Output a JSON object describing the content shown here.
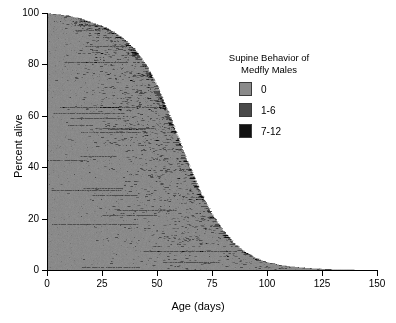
{
  "chart_data": {
    "type": "area",
    "title": "",
    "xlabel": "Age (days)",
    "ylabel": "Percent alive",
    "xlim": [
      0,
      150
    ],
    "ylim": [
      0,
      100
    ],
    "xticks": [
      0,
      25,
      50,
      75,
      100,
      125,
      150
    ],
    "yticks": [
      0,
      20,
      40,
      60,
      80,
      100
    ],
    "grid": false,
    "legend_position": "upper-right-inside",
    "categories": [
      "0",
      "1-6",
      "7-12"
    ],
    "series": [
      {
        "name": "0",
        "color": "#8a8a8a"
      },
      {
        "name": "1-6",
        "color": "#4a4a4a"
      },
      {
        "name": "7-12",
        "color": "#111111"
      }
    ],
    "survival_curve": {
      "x": [
        0,
        5,
        10,
        15,
        20,
        25,
        30,
        35,
        40,
        45,
        50,
        55,
        60,
        65,
        70,
        75,
        80,
        85,
        90,
        95,
        100,
        105,
        110,
        115,
        120,
        125,
        130,
        135,
        140
      ],
      "y": [
        100,
        99.5,
        99,
        98,
        96.5,
        95,
        93,
        90,
        86,
        80,
        72,
        62,
        51,
        40,
        30,
        22,
        15.5,
        10.5,
        7,
        4.6,
        3.0,
        2.0,
        1.4,
        0.9,
        0.6,
        0.35,
        0.15,
        0.05,
        0
      ]
    }
  },
  "legend": {
    "title": "Supine Behavior of\nMedfly Males",
    "items": [
      {
        "label": "0",
        "color": "#8a8a8a"
      },
      {
        "label": "1-6",
        "color": "#4a4a4a"
      },
      {
        "label": "7-12",
        "color": "#111111"
      }
    ]
  },
  "axes": {
    "x_title": "Age (days)",
    "y_title": "Percent alive",
    "x_ticklabels": [
      "0",
      "25",
      "50",
      "75",
      "100",
      "125",
      "150"
    ],
    "y_ticklabels": [
      "0",
      "20",
      "40",
      "60",
      "80",
      "100"
    ]
  }
}
